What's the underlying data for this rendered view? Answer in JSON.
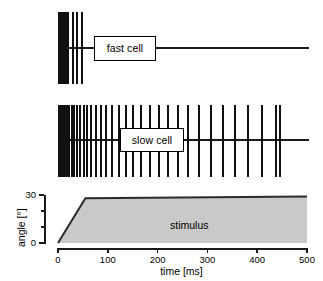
{
  "figure": {
    "title": "",
    "background": "#ffffff",
    "ink_color": "#111111",
    "stimulus_fill": "#c9c9c9",
    "stimulus_edge": "#2b2b2b"
  },
  "panels": {
    "fast_cell": {
      "label": "fast cell",
      "baseline_start_ms": 0,
      "baseline_end_ms": 505,
      "spike_times_ms": [
        2,
        5,
        8,
        11,
        14,
        17,
        21,
        30,
        39,
        48
      ]
    },
    "slow_cell": {
      "label": "slow cell",
      "baseline_start_ms": 0,
      "baseline_end_ms": 505,
      "spike_times_ms": [
        2,
        6,
        10,
        14,
        18,
        23,
        28,
        33,
        39,
        45,
        52,
        59,
        67,
        76,
        86,
        97,
        109,
        122,
        136,
        151,
        167,
        184,
        202,
        221,
        241,
        262,
        284,
        307,
        331,
        356,
        382,
        409,
        437,
        446
      ]
    }
  },
  "chart_data": {
    "type": "area",
    "title": "",
    "annotation": "stimulus",
    "xlabel": "time [ms]",
    "ylabel": "angle [°]",
    "xlim": [
      0,
      500
    ],
    "ylim": [
      0,
      30
    ],
    "xticks": [
      0,
      100,
      200,
      300,
      400,
      500
    ],
    "xtick_labels": [
      "0",
      "100",
      "200",
      "300",
      "400",
      "500"
    ],
    "yticks": [
      0,
      30
    ],
    "ytick_labels": [
      "0",
      "30"
    ],
    "yminor_ticks": [
      10,
      20
    ],
    "grid": false,
    "legend": null,
    "series": [
      {
        "name": "stimulus",
        "x": [
          0,
          55,
          500
        ],
        "y": [
          0,
          28,
          29
        ]
      }
    ]
  }
}
